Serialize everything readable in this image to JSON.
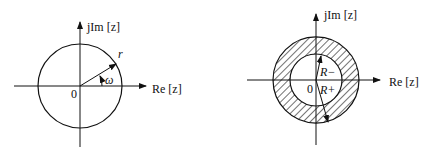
{
  "left_diagram": {
    "y_axis_label": "jIm [z]",
    "x_axis_label": "Re [z]",
    "origin_label": "0",
    "radius_label": "r",
    "angle_label": "ω"
  },
  "right_diagram": {
    "y_axis_label": "jIm [z]",
    "x_axis_label": "Re [z]",
    "origin_label": "0",
    "inner_radius_label": "R−",
    "outer_radius_label": "R+"
  },
  "colors": {
    "ink": "#111111",
    "background": "#ffffff"
  }
}
